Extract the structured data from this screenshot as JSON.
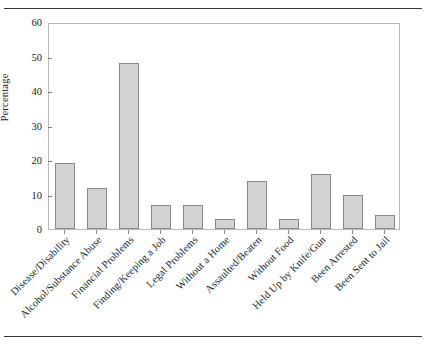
{
  "chart_data": {
    "type": "bar",
    "title": "",
    "subtitle": "",
    "xlabel": "",
    "ylabel": "Percentage",
    "ylim": [
      0,
      60
    ],
    "yticks": [
      0,
      10,
      20,
      30,
      40,
      50,
      60
    ],
    "grid": false,
    "legend": false,
    "legend_position": "none",
    "bar_fill_color": "#d2d2d2",
    "bar_edge_color": "#8a8a8a",
    "axis_color": "#b9b9b9",
    "categories": [
      "Disease/Disability",
      "Alcohol/Substance Abuse",
      "Financial Problems",
      "Finding/Keeping a Job",
      "Legal Problems",
      "Without a Home",
      "Assaulted/Beaten",
      "Without Food",
      "Held Up by Knife/Gun",
      "Been Arrested",
      "Been Sent to Jail"
    ],
    "values": [
      19,
      12,
      48,
      7,
      7,
      3,
      14,
      3,
      16,
      10,
      4
    ]
  }
}
